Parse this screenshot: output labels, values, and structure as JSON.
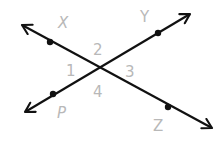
{
  "diagram": {
    "colors": {
      "line": "#111111",
      "label": "#b8b8b8",
      "background": "#ffffff"
    },
    "intersection": {
      "x": 99,
      "y": 69
    },
    "lines": [
      {
        "name": "line-XZ",
        "from": [
          22,
          25
        ],
        "to": [
          212,
          128
        ]
      },
      {
        "name": "line-PY",
        "from": [
          25,
          112
        ],
        "to": [
          190,
          14
        ]
      }
    ],
    "points": [
      {
        "label": "X",
        "x": 50,
        "y": 42,
        "label_x": 58,
        "label_y": 28
      },
      {
        "label": "Y",
        "x": 158,
        "y": 33,
        "label_x": 140,
        "label_y": 22
      },
      {
        "label": "P",
        "x": 53,
        "y": 94,
        "label_x": 57,
        "label_y": 114
      },
      {
        "label": "Z",
        "x": 168,
        "y": 107,
        "label_x": 153,
        "label_y": 131
      }
    ],
    "angles": [
      {
        "label": "1",
        "x": 67,
        "y": 75
      },
      {
        "label": "2",
        "x": 93,
        "y": 55
      },
      {
        "label": "3",
        "x": 126,
        "y": 76
      },
      {
        "label": "4",
        "x": 93,
        "y": 96
      }
    ]
  }
}
